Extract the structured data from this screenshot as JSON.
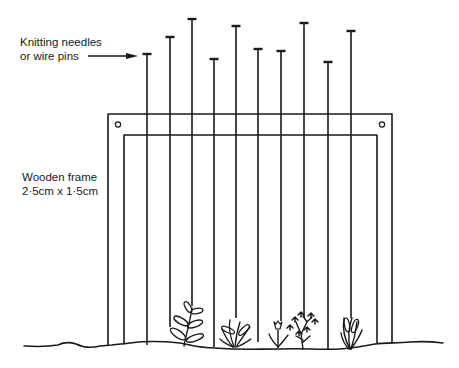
{
  "diagram": {
    "labels": {
      "needles": [
        "Knitting needles",
        "or wire pins"
      ],
      "frame": [
        "Wooden frame",
        "2·5cm x 1·5cm"
      ]
    },
    "needles": [
      {
        "id": 1,
        "hangs_to": "ground"
      },
      {
        "id": 2,
        "hangs_to": "near-plant"
      },
      {
        "id": 3,
        "hangs_to": "plant-1"
      },
      {
        "id": 4,
        "hangs_to": "ground"
      },
      {
        "id": 5,
        "hangs_to": "plant-2"
      },
      {
        "id": 6,
        "hangs_to": "ground"
      },
      {
        "id": 7,
        "hangs_to": "plant-3"
      },
      {
        "id": 8,
        "hangs_to": "plant-4"
      },
      {
        "id": 9,
        "hangs_to": "ground"
      },
      {
        "id": 10,
        "hangs_to": "plant-5"
      }
    ],
    "plants": [
      "leafy-sprig",
      "grass-tuft",
      "tulip-bud",
      "flowering-bush",
      "spiky-tuft"
    ],
    "line_color": "#1a1a1a"
  }
}
